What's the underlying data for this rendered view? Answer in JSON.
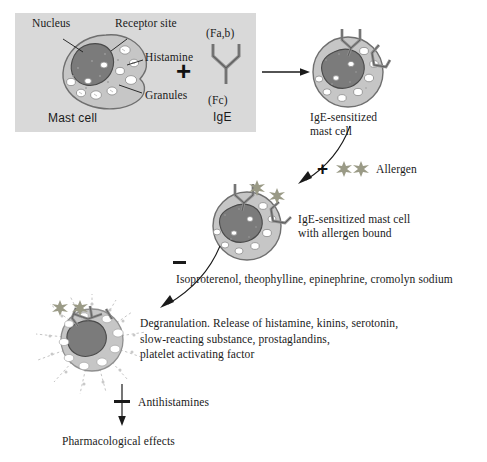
{
  "legend_panel": {
    "labels": {
      "nucleus": "Nucleus",
      "receptor_site": "Receptor site",
      "histamine": "Histamine",
      "granules": "Granules",
      "mast_cell": "Mast cell"
    },
    "antibody": {
      "fab": "(Fa,b)",
      "fc": "(Fc)",
      "name": "IgE"
    },
    "plus": "+",
    "background_color": "#d9d9d9"
  },
  "step_sensitized": {
    "label": "IgE-sensitized\nmast cell"
  },
  "allergen_step": {
    "plus": "+",
    "label": "Allergen"
  },
  "step_bound": {
    "label": "IgE-sensitized mast cell\nwith allergen bound"
  },
  "inhibitors_step": {
    "sign": "–",
    "label": "Isoproterenol, theophylline, epinephrine, cromolyn sodium"
  },
  "step_degranulation": {
    "label": "Degranulation. Release of histamine, kinins, serotonin,\nslow-reacting substance, prostaglandins,\nplatelet activating factor"
  },
  "antihistamine_step": {
    "sign": "–",
    "label": "Antihistamines"
  },
  "outcome": {
    "label": "Pharmacological effects"
  },
  "colors": {
    "panel_bg": "#d9d9d9",
    "cell_fill": "#c6c6c6",
    "cell_stroke": "#6f6f6f",
    "nucleus_fill": "#7b7b7b",
    "nucleus_stroke": "#4a4a4a",
    "granule_fill": "#ffffff",
    "granule_stroke": "#8a8a8a",
    "allergen": "#9a9a86",
    "ink": "#1a1a1a"
  }
}
